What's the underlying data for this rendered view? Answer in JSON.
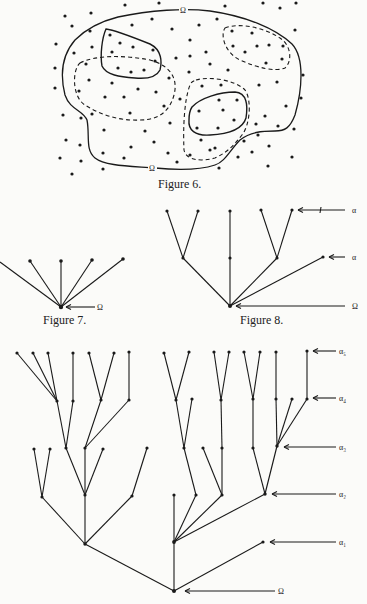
{
  "figures": {
    "fig6": {
      "caption": "Figure 6.",
      "omega_top_label": "Ω",
      "omega_bottom_label": "Ω",
      "description": "Region Ω (solid outline) scattered with points; two solid-bounded subsets and three dashed-bounded subsets"
    },
    "fig7": {
      "caption": "Figure 7.",
      "root_label": "Ω",
      "leaf_count": 5
    },
    "fig8": {
      "caption": "Figure 8.",
      "labels": {
        "top": "α",
        "middle": "α",
        "root": "Ω"
      }
    },
    "fig9": {
      "level_labels": [
        "α₅",
        "α₄",
        "α₃",
        "α₂",
        "α₁"
      ],
      "root_label": "Ω"
    }
  }
}
